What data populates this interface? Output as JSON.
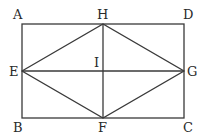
{
  "diagram": {
    "type": "geometry",
    "points": {
      "A": {
        "label": "A",
        "x": 22,
        "y": 24
      },
      "B": {
        "label": "B",
        "x": 22,
        "y": 118
      },
      "C": {
        "label": "C",
        "x": 184,
        "y": 118
      },
      "D": {
        "label": "D",
        "x": 184,
        "y": 24
      },
      "E": {
        "label": "E",
        "x": 22,
        "y": 71
      },
      "F": {
        "label": "F",
        "x": 103,
        "y": 118
      },
      "G": {
        "label": "G",
        "x": 184,
        "y": 71
      },
      "H": {
        "label": "H",
        "x": 103,
        "y": 24
      },
      "I": {
        "label": "I",
        "x": 103,
        "y": 71
      }
    },
    "segments": [
      [
        "A",
        "D"
      ],
      [
        "D",
        "C"
      ],
      [
        "C",
        "B"
      ],
      [
        "B",
        "A"
      ],
      [
        "E",
        "H"
      ],
      [
        "H",
        "G"
      ],
      [
        "G",
        "F"
      ],
      [
        "F",
        "E"
      ],
      [
        "E",
        "G"
      ],
      [
        "H",
        "F"
      ]
    ],
    "colors": {
      "line": "#3a3a3a",
      "text": "#2a2a2a",
      "background": "#ffffff"
    }
  }
}
